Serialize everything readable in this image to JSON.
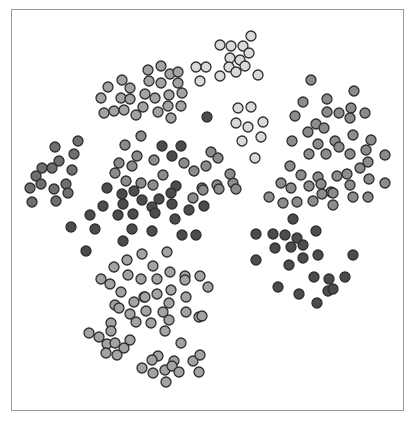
{
  "chart_data": {
    "type": "scatter",
    "title": "",
    "xlabel": "",
    "ylabel": "",
    "legend": [],
    "grid": false,
    "axes_visible": false,
    "frame": {
      "x": 11,
      "y": 9,
      "width": 393,
      "height": 402,
      "border_color": "#9a9a9a"
    },
    "marker": {
      "radius": 5,
      "stroke": "#2e2e2e",
      "stroke_width": 1.3
    },
    "shades": {
      "vlight": "#d9d9d9",
      "light": "#a3a3a3",
      "mid": "#8c8c8c",
      "mdark": "#6f6f6f",
      "dark": "#4c4c4c"
    },
    "coordinate_space": "pixel coordinates of the 414x421 image; no numeric axes shown",
    "series": [
      {
        "name": "cluster-top-right-light",
        "shade": "vlight",
        "points": [
          [
            251,
            36
          ],
          [
            220,
            45
          ],
          [
            231,
            46
          ],
          [
            243,
            46
          ],
          [
            249,
            53
          ],
          [
            230,
            58
          ],
          [
            240,
            60
          ],
          [
            229,
            67
          ],
          [
            236,
            72
          ],
          [
            245,
            66
          ],
          [
            258,
            75
          ],
          [
            220,
            76
          ],
          [
            196,
            67
          ],
          [
            206,
            67
          ],
          [
            200,
            81
          ]
        ]
      },
      {
        "name": "cluster-top-left",
        "shade": "light",
        "points": [
          [
            148,
            70
          ],
          [
            161,
            66
          ],
          [
            170,
            74
          ],
          [
            178,
            72
          ],
          [
            122,
            80
          ],
          [
            149,
            81
          ],
          [
            161,
            83
          ],
          [
            178,
            83
          ],
          [
            108,
            87
          ],
          [
            130,
            88
          ],
          [
            101,
            98
          ],
          [
            121,
            98
          ],
          [
            130,
            99
          ],
          [
            145,
            94
          ],
          [
            155,
            98
          ],
          [
            169,
            95
          ],
          [
            182,
            93
          ],
          [
            143,
            107
          ],
          [
            168,
            106
          ],
          [
            181,
            106
          ],
          [
            104,
            113
          ],
          [
            114,
            111
          ],
          [
            124,
            110
          ],
          [
            136,
            115
          ],
          [
            158,
            112
          ],
          [
            171,
            118
          ]
        ]
      },
      {
        "name": "cluster-left",
        "shade": "mdark",
        "points": [
          [
            78,
            141
          ],
          [
            55,
            147
          ],
          [
            74,
            154
          ],
          [
            59,
            161
          ],
          [
            42,
            168
          ],
          [
            52,
            168
          ],
          [
            72,
            170
          ],
          [
            36,
            176
          ],
          [
            41,
            184
          ],
          [
            30,
            188
          ],
          [
            54,
            189
          ],
          [
            66,
            184
          ],
          [
            68,
            193
          ],
          [
            32,
            202
          ],
          [
            56,
            201
          ]
        ]
      },
      {
        "name": "cluster-center-mixed",
        "shade": "mid",
        "points": [
          [
            141,
            136
          ],
          [
            125,
            145
          ],
          [
            137,
            156
          ],
          [
            119,
            163
          ],
          [
            154,
            160
          ],
          [
            184,
            163
          ],
          [
            115,
            173
          ],
          [
            132,
            166
          ],
          [
            163,
            175
          ],
          [
            141,
            183
          ],
          [
            153,
            185
          ],
          [
            126,
            181
          ],
          [
            211,
            152
          ],
          [
            218,
            158
          ],
          [
            206,
            166
          ],
          [
            194,
            171
          ],
          [
            202,
            188
          ],
          [
            193,
            198
          ],
          [
            233,
            183
          ],
          [
            230,
            174
          ],
          [
            217,
            185
          ],
          [
            219,
            189
          ],
          [
            203,
            190
          ],
          [
            236,
            189
          ]
        ]
      },
      {
        "name": "cluster-center-dark",
        "shade": "dark",
        "points": [
          [
            162,
            146
          ],
          [
            181,
            146
          ],
          [
            172,
            156
          ],
          [
            107,
            188
          ],
          [
            122,
            194
          ],
          [
            134,
            191
          ],
          [
            176,
            186
          ],
          [
            171,
            193
          ],
          [
            123,
            204
          ],
          [
            142,
            200
          ],
          [
            159,
            199
          ],
          [
            152,
            207
          ],
          [
            172,
            204
          ],
          [
            189,
            210
          ],
          [
            204,
            206
          ],
          [
            103,
            206
          ],
          [
            90,
            215
          ],
          [
            118,
            215
          ],
          [
            133,
            214
          ],
          [
            155,
            213
          ],
          [
            175,
            219
          ],
          [
            95,
            229
          ],
          [
            132,
            229
          ],
          [
            152,
            231
          ],
          [
            182,
            235
          ],
          [
            196,
            235
          ],
          [
            123,
            241
          ],
          [
            207,
            117
          ],
          [
            86,
            251
          ],
          [
            71,
            227
          ]
        ]
      },
      {
        "name": "cluster-light-mid-right",
        "shade": "vlight",
        "points": [
          [
            238,
            108
          ],
          [
            251,
            107
          ],
          [
            263,
            122
          ],
          [
            236,
            123
          ],
          [
            248,
            127
          ],
          [
            261,
            137
          ],
          [
            242,
            141
          ],
          [
            255,
            158
          ]
        ]
      },
      {
        "name": "cluster-right-upper",
        "shade": "mid",
        "points": [
          [
            311,
            80
          ],
          [
            354,
            91
          ],
          [
            303,
            102
          ],
          [
            327,
            99
          ],
          [
            351,
            108
          ],
          [
            295,
            116
          ],
          [
            327,
            112
          ],
          [
            339,
            113
          ],
          [
            350,
            118
          ],
          [
            365,
            113
          ],
          [
            316,
            124
          ],
          [
            324,
            128
          ],
          [
            292,
            141
          ],
          [
            308,
            132
          ],
          [
            318,
            144
          ],
          [
            335,
            141
          ],
          [
            353,
            135
          ],
          [
            371,
            140
          ],
          [
            309,
            154
          ],
          [
            326,
            154
          ],
          [
            339,
            147
          ],
          [
            350,
            154
          ],
          [
            366,
            150
          ],
          [
            385,
            155
          ],
          [
            290,
            166
          ],
          [
            301,
            175
          ],
          [
            318,
            177
          ],
          [
            337,
            176
          ],
          [
            347,
            174
          ],
          [
            360,
            168
          ],
          [
            368,
            162
          ],
          [
            281,
            183
          ],
          [
            291,
            188
          ],
          [
            309,
            186
          ],
          [
            321,
            184
          ],
          [
            331,
            192
          ],
          [
            350,
            185
          ],
          [
            369,
            179
          ],
          [
            385,
            183
          ],
          [
            269,
            197
          ],
          [
            283,
            203
          ],
          [
            297,
            202
          ],
          [
            313,
            201
          ],
          [
            333,
            193
          ],
          [
            353,
            197
          ],
          [
            368,
            197
          ],
          [
            333,
            205
          ],
          [
            322,
            194
          ]
        ]
      },
      {
        "name": "cluster-right-lower-dark",
        "shade": "dark",
        "points": [
          [
            293,
            219
          ],
          [
            256,
            234
          ],
          [
            273,
            234
          ],
          [
            285,
            235
          ],
          [
            297,
            238
          ],
          [
            316,
            231
          ],
          [
            275,
            248
          ],
          [
            291,
            247
          ],
          [
            303,
            245
          ],
          [
            318,
            255
          ],
          [
            256,
            260
          ],
          [
            289,
            265
          ],
          [
            303,
            258
          ],
          [
            353,
            255
          ],
          [
            314,
            277
          ],
          [
            329,
            279
          ],
          [
            345,
            277
          ],
          [
            278,
            287
          ],
          [
            299,
            294
          ],
          [
            328,
            291
          ],
          [
            333,
            289
          ],
          [
            317,
            303
          ]
        ]
      },
      {
        "name": "cluster-bottom-left",
        "shade": "light",
        "points": [
          [
            167,
            252
          ],
          [
            127,
            260
          ],
          [
            142,
            254
          ],
          [
            114,
            267
          ],
          [
            153,
            266
          ],
          [
            101,
            279
          ],
          [
            128,
            275
          ],
          [
            141,
            279
          ],
          [
            157,
            279
          ],
          [
            170,
            272
          ],
          [
            185,
            276
          ],
          [
            171,
            290
          ],
          [
            110,
            284
          ],
          [
            121,
            292
          ],
          [
            144,
            297
          ],
          [
            157,
            294
          ],
          [
            185,
            280
          ],
          [
            200,
            276
          ],
          [
            208,
            287
          ],
          [
            115,
            305
          ],
          [
            134,
            302
          ],
          [
            145,
            297
          ],
          [
            169,
            303
          ],
          [
            186,
            297
          ],
          [
            199,
            317
          ],
          [
            119,
            308
          ],
          [
            130,
            314
          ],
          [
            146,
            311
          ],
          [
            163,
            312
          ],
          [
            169,
            320
          ],
          [
            186,
            312
          ],
          [
            202,
            316
          ],
          [
            151,
            323
          ],
          [
            136,
            322
          ],
          [
            111,
            323
          ],
          [
            181,
            343
          ],
          [
            165,
            331
          ],
          [
            111,
            331
          ],
          [
            89,
            333
          ],
          [
            99,
            337
          ],
          [
            107,
            344
          ],
          [
            115,
            343
          ],
          [
            124,
            348
          ],
          [
            106,
            353
          ],
          [
            117,
            355
          ],
          [
            130,
            340
          ],
          [
            158,
            356
          ],
          [
            152,
            360
          ],
          [
            174,
            361
          ],
          [
            193,
            361
          ],
          [
            200,
            355
          ],
          [
            142,
            368
          ],
          [
            153,
            373
          ],
          [
            165,
            370
          ],
          [
            172,
            366
          ],
          [
            179,
            372
          ],
          [
            166,
            382
          ],
          [
            199,
            372
          ]
        ]
      }
    ]
  }
}
